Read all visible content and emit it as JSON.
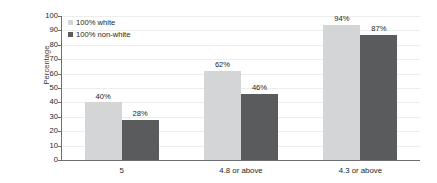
{
  "chart_data": {
    "type": "bar",
    "title": "",
    "xlabel": "",
    "ylabel": "Percentage",
    "ylim": [
      0,
      100
    ],
    "ytick_step": 10,
    "yticks": [
      "100",
      "90",
      "80",
      "70",
      "60",
      "50",
      "40",
      "30",
      "20",
      "10",
      "0"
    ],
    "categories": [
      "5",
      "4.8 or above",
      "4.3 or above"
    ],
    "grid": true,
    "legend_position": "top-left",
    "series": [
      {
        "name": "100% white",
        "color": "#d4d5d6",
        "values": [
          40,
          62,
          94
        ],
        "labels": [
          "40%",
          "62%",
          "94%"
        ]
      },
      {
        "name": "100% non-white",
        "color": "#5a5b5d",
        "values": [
          28,
          46,
          87
        ],
        "labels": [
          "28%",
          "46%",
          "87%"
        ]
      }
    ]
  },
  "legend": {
    "items": [
      {
        "label": "100% white",
        "swatch": "light"
      },
      {
        "label": "100% non-white",
        "swatch": "dark"
      }
    ]
  },
  "axis": {
    "y_title": "Percentage"
  }
}
